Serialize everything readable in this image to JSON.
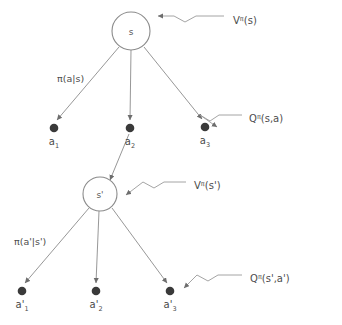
{
  "diagram": {
    "colors": {
      "background": "#ffffff",
      "edge_stroke": "#8b8b8b",
      "node_fill": "#3a3a3a",
      "circle_stroke": "#8b8b8b",
      "text": "#4d4d4d"
    },
    "states": [
      {
        "id": "s",
        "label": "s",
        "cx": 131,
        "cy": 31,
        "r": 19
      },
      {
        "id": "s_prime",
        "label": "s'",
        "cx": 100,
        "cy": 194,
        "r": 17
      }
    ],
    "actions": [
      {
        "id": "a1",
        "base": "a",
        "sub": "1",
        "prime": "",
        "cx": 54,
        "cy": 128
      },
      {
        "id": "a2",
        "base": "a",
        "sub": "2",
        "prime": "",
        "cx": 130,
        "cy": 128
      },
      {
        "id": "a3",
        "base": "a",
        "sub": "3",
        "prime": "",
        "cx": 205,
        "cy": 127
      },
      {
        "id": "a1p",
        "base": "a",
        "sub": "1",
        "prime": "'",
        "cx": 22,
        "cy": 291
      },
      {
        "id": "a2p",
        "base": "a",
        "sub": "2",
        "prime": "'",
        "cx": 96,
        "cy": 291
      },
      {
        "id": "a3p",
        "base": "a",
        "sub": "3",
        "prime": "'",
        "cx": 170,
        "cy": 291
      }
    ],
    "edge_labels": [
      {
        "id": "policy-top",
        "text": "π(a|s)",
        "x": 57,
        "y": 82
      },
      {
        "id": "policy-bottom",
        "text": "π(a'|s')",
        "x": 14,
        "y": 245
      }
    ],
    "callouts": [
      {
        "id": "v-pi-s",
        "base": "V",
        "sup": "π",
        "args": "(s)",
        "text_x": 233,
        "text_y": 24,
        "target_x": 154,
        "target_y": 31
      },
      {
        "id": "q-pi-s-a",
        "base": "Q",
        "sup": "π",
        "args": "(s,a)",
        "text_x": 249,
        "text_y": 122,
        "target_x": 213,
        "target_y": 127
      },
      {
        "id": "v-pi-s-prime",
        "base": "V",
        "sup": "π",
        "args": "(s')",
        "text_x": 194,
        "text_y": 189,
        "target_x": 122,
        "target_y": 195
      },
      {
        "id": "q-pi-s-prime-a-prime",
        "base": "Q",
        "sup": "π",
        "args": "(s',a')",
        "text_x": 250,
        "text_y": 282,
        "target_x": 180,
        "target_y": 288
      }
    ]
  }
}
